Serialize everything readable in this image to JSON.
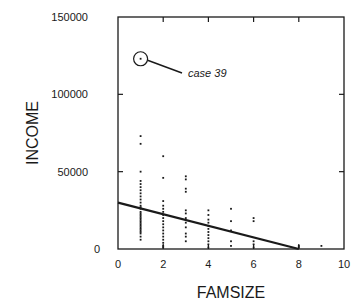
{
  "chart_data": {
    "type": "scatter",
    "title": "",
    "xlabel": "FAMSIZE",
    "ylabel": "INCOME",
    "xlim": [
      0,
      10
    ],
    "ylim": [
      0,
      150000
    ],
    "x_ticks": [
      0,
      2,
      4,
      6,
      8,
      10
    ],
    "x_tick_labels": [
      "0",
      "2",
      "4",
      "6",
      "8",
      "10"
    ],
    "y_ticks": [
      0,
      50000,
      100000,
      150000
    ],
    "y_tick_labels": [
      "0",
      "50000",
      "100000",
      "150000"
    ],
    "grid": false,
    "legend": null,
    "series": [
      {
        "name": "observations",
        "points": [
          [
            1,
            123000
          ],
          [
            1,
            73000
          ],
          [
            1,
            68000
          ],
          [
            1,
            50000
          ],
          [
            1,
            44000
          ],
          [
            1,
            42000
          ],
          [
            1,
            40000
          ],
          [
            1,
            38000
          ],
          [
            1,
            36000
          ],
          [
            1,
            34000
          ],
          [
            1,
            32000
          ],
          [
            1,
            30000
          ],
          [
            1,
            28000
          ],
          [
            1,
            27000
          ],
          [
            1,
            26000
          ],
          [
            1,
            24000
          ],
          [
            1,
            23000
          ],
          [
            1,
            22000
          ],
          [
            1,
            21000
          ],
          [
            1,
            20000
          ],
          [
            1,
            19000
          ],
          [
            1,
            18000
          ],
          [
            1,
            17000
          ],
          [
            1,
            16000
          ],
          [
            1,
            15000
          ],
          [
            1,
            14000
          ],
          [
            1,
            13000
          ],
          [
            1,
            12000
          ],
          [
            1,
            11000
          ],
          [
            1,
            10000
          ],
          [
            1,
            8000
          ],
          [
            1,
            6000
          ],
          [
            2,
            60000
          ],
          [
            2,
            46000
          ],
          [
            2,
            31000
          ],
          [
            2,
            28000
          ],
          [
            2,
            26000
          ],
          [
            2,
            24000
          ],
          [
            2,
            22000
          ],
          [
            2,
            20000
          ],
          [
            2,
            18000
          ],
          [
            2,
            16000
          ],
          [
            2,
            14000
          ],
          [
            2,
            12000
          ],
          [
            2,
            10000
          ],
          [
            2,
            8000
          ],
          [
            2,
            6000
          ],
          [
            2,
            4000
          ],
          [
            2,
            2000
          ],
          [
            2,
            1000
          ],
          [
            3,
            47000
          ],
          [
            3,
            45000
          ],
          [
            3,
            39000
          ],
          [
            3,
            37000
          ],
          [
            3,
            25000
          ],
          [
            3,
            23000
          ],
          [
            3,
            20000
          ],
          [
            3,
            17000
          ],
          [
            3,
            14000
          ],
          [
            3,
            10000
          ],
          [
            3,
            8000
          ],
          [
            3,
            5000
          ],
          [
            4,
            25000
          ],
          [
            4,
            22000
          ],
          [
            4,
            19000
          ],
          [
            4,
            17000
          ],
          [
            4,
            15000
          ],
          [
            4,
            13000
          ],
          [
            4,
            11000
          ],
          [
            4,
            9000
          ],
          [
            4,
            7000
          ],
          [
            4,
            5000
          ],
          [
            4,
            3000
          ],
          [
            4,
            1000
          ],
          [
            5,
            26000
          ],
          [
            5,
            18000
          ],
          [
            5,
            12000
          ],
          [
            5,
            5000
          ],
          [
            5,
            2000
          ],
          [
            6,
            20000
          ],
          [
            6,
            18000
          ],
          [
            6,
            5000
          ],
          [
            6,
            3000
          ],
          [
            6,
            1000
          ],
          [
            8,
            2000
          ],
          [
            8,
            1000
          ],
          [
            9,
            2000
          ]
        ]
      }
    ],
    "regression_line": {
      "name": "fitted line",
      "from": [
        0,
        30000
      ],
      "to": [
        8,
        0
      ]
    },
    "annotations": [
      {
        "text": "case 39",
        "target": [
          1,
          123000
        ],
        "marker": "circle"
      }
    ]
  }
}
